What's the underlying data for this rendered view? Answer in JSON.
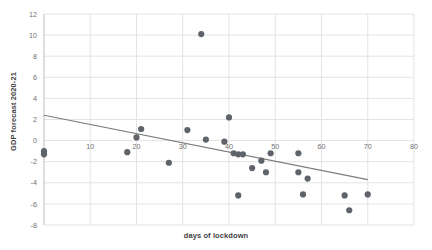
{
  "chart_data": {
    "type": "scatter",
    "title": "",
    "xlabel": "days of lockdown",
    "ylabel": "GDP forecast 2020-21",
    "xlim": [
      0,
      80
    ],
    "ylim": [
      -8,
      12
    ],
    "xticks": [
      0,
      10,
      20,
      30,
      40,
      50,
      60,
      70,
      80
    ],
    "xtick_labels": [
      "",
      "10",
      "20",
      "30",
      "40",
      "50",
      "60",
      "70",
      "80"
    ],
    "yticks": [
      -8,
      -6,
      -4,
      -2,
      0,
      2,
      4,
      6,
      8,
      10,
      12
    ],
    "ytick_labels": [
      "-8",
      "-6",
      "-4",
      "-2",
      "0",
      "2",
      "4",
      "6",
      "8",
      "10",
      "12"
    ],
    "grid": true,
    "legend": "none",
    "marker_color": "#5f646b",
    "gridline_color": "#e3e3e3",
    "trendline_color": "#7b7b7b",
    "points": [
      {
        "x": 0,
        "y": -1.0
      },
      {
        "x": 0,
        "y": -1.3
      },
      {
        "x": 18,
        "y": -1.1
      },
      {
        "x": 20,
        "y": 0.3
      },
      {
        "x": 21,
        "y": 1.1
      },
      {
        "x": 27,
        "y": -2.1
      },
      {
        "x": 31,
        "y": 1.0
      },
      {
        "x": 34,
        "y": 10.1
      },
      {
        "x": 35,
        "y": 0.1
      },
      {
        "x": 39,
        "y": -0.1
      },
      {
        "x": 40,
        "y": 2.2
      },
      {
        "x": 41,
        "y": -1.2
      },
      {
        "x": 42,
        "y": -1.3
      },
      {
        "x": 43,
        "y": -1.3
      },
      {
        "x": 42,
        "y": -5.2
      },
      {
        "x": 45,
        "y": -2.6
      },
      {
        "x": 47,
        "y": -1.9
      },
      {
        "x": 48,
        "y": -3.0
      },
      {
        "x": 49,
        "y": -1.2
      },
      {
        "x": 55,
        "y": -1.2
      },
      {
        "x": 55,
        "y": -3.0
      },
      {
        "x": 56,
        "y": -5.1
      },
      {
        "x": 57,
        "y": -3.6
      },
      {
        "x": 65,
        "y": -5.2
      },
      {
        "x": 66,
        "y": -6.6
      },
      {
        "x": 70,
        "y": -5.1
      }
    ],
    "trendline": {
      "x0": 0,
      "y0": 2.4,
      "x1": 70,
      "y1": -3.7
    }
  }
}
